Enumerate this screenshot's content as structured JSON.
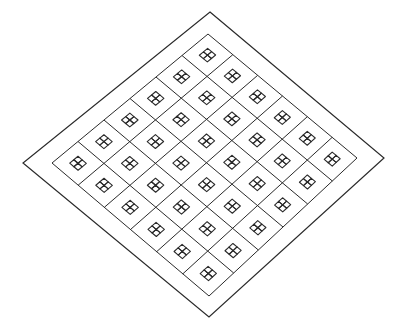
{
  "diagram": {
    "stroke_color": "#2a2a2a",
    "background_color": "#ffffff",
    "outer_frame": {
      "top": [
        210,
        12
      ],
      "right": [
        384,
        158
      ],
      "bottom": [
        209,
        317
      ],
      "left": [
        23,
        163
      ]
    },
    "inner_grid": {
      "top": [
        208,
        34
      ],
      "right": [
        357,
        158
      ],
      "bottom": [
        209,
        296
      ],
      "left": [
        52,
        163
      ],
      "rows": 6,
      "cols": 6
    },
    "cell_icon": {
      "name": "four-pane-window-icon",
      "size_fraction": 0.32
    }
  }
}
